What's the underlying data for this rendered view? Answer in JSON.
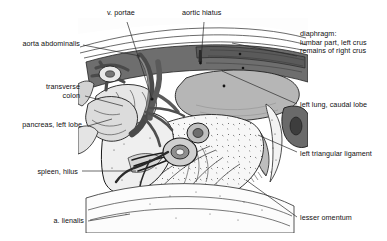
{
  "figure": {
    "type": "anatomical-illustration",
    "background_color": "#ffffff",
    "ink_color": "#101010",
    "label_font_size_px": 7.2,
    "palette": {
      "outline": "#1a1a1a",
      "leader_line": "#2b2b2b",
      "dark_gray": "#5d5d5d",
      "mid_gray": "#8e8e8e",
      "light_gray": "#c9c9c9",
      "pale_gray": "#e2e2e2",
      "near_white": "#f4f4f4",
      "vessel_dark": "#4a4a4a",
      "stipple": "#3a3a3a"
    }
  },
  "labels": [
    {
      "id": "v-portae",
      "text": "v. portae",
      "align": "left",
      "x": 107,
      "y": 9,
      "leader": {
        "from_x": 127,
        "from_y": 22,
        "to_x": 152,
        "to_y": 99
      }
    },
    {
      "id": "aortic-hiatus",
      "text": "aortic hiatus",
      "align": "left",
      "x": 182,
      "y": 9,
      "leader": {
        "from_x": 204,
        "from_y": 22,
        "to_x": 201,
        "to_y": 60
      }
    },
    {
      "id": "aorta-abdominalis",
      "text": "aorta abdominalis",
      "align": "right",
      "x": 16,
      "y": 40,
      "leader": {
        "from_x": 83,
        "from_y": 45,
        "to_x": 140,
        "to_y": 56
      }
    },
    {
      "id": "diaphragm",
      "text": "diaphragm:",
      "lines": [
        "diaphragm:",
        "lumbar part, left crus",
        "remains of right crus"
      ],
      "align": "left",
      "x": 300,
      "y": 30,
      "leader": {
        "from_x": 297,
        "from_y": 56,
        "to_x": 232,
        "to_y": 43
      }
    },
    {
      "id": "transverse-colon",
      "text": "transverse colon",
      "lines": [
        "transverse",
        "colon"
      ],
      "align": "right",
      "x": 16,
      "y": 83,
      "leader": {
        "from_x": 85,
        "from_y": 96,
        "to_x": 123,
        "to_y": 106
      }
    },
    {
      "id": "left-lung-caudal-lobe",
      "text": "left lung, caudal lobe",
      "align": "left",
      "x": 300,
      "y": 101,
      "leader": {
        "from_x": 297,
        "from_y": 104,
        "to_x": 222,
        "to_y": 71
      }
    },
    {
      "id": "pancreas-left-lobe",
      "text": "pancreas, left lobe",
      "align": "right",
      "x": 16,
      "y": 121,
      "leader": {
        "from_x": 88,
        "from_y": 126,
        "to_x": 112,
        "to_y": 119
      }
    },
    {
      "id": "left-triangular-ligament",
      "text": "left triangular ligament",
      "align": "left",
      "x": 300,
      "y": 150,
      "leader": {
        "from_x": 297,
        "from_y": 152,
        "to_x": 258,
        "to_y": 135
      }
    },
    {
      "id": "spleen-hilus",
      "text": "spleen, hilus",
      "align": "right",
      "x": 16,
      "y": 168,
      "leader": {
        "from_x": 82,
        "from_y": 171,
        "to_x": 136,
        "to_y": 171
      }
    },
    {
      "id": "a-lienalis",
      "text": "a. lienalis",
      "align": "right",
      "x": 46,
      "y": 217,
      "leader": {
        "from_x": 88,
        "from_y": 221,
        "to_x": 130,
        "to_y": 214
      }
    },
    {
      "id": "lesser-omentum",
      "text": "lesser omentum",
      "align": "left",
      "x": 300,
      "y": 214,
      "leader": {
        "from_x": 297,
        "from_y": 217,
        "to_x": 246,
        "to_y": 180
      }
    }
  ]
}
